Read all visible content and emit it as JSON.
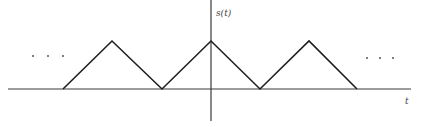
{
  "chart_data": {
    "type": "line",
    "title": "",
    "ylabel": "s(t)",
    "xlabel": "t",
    "grid": false,
    "legend": null,
    "continuation_marks": [
      "...",
      "..."
    ],
    "pixel_geometry": {
      "x_axis_y": 89,
      "x_axis_x_range": [
        8,
        411
      ],
      "y_axis_x": 211,
      "y_axis_y_range": [
        0,
        121
      ],
      "peak_y": 41,
      "points": [
        [
          63,
          89
        ],
        [
          112,
          41
        ],
        [
          162,
          89
        ],
        [
          211,
          41
        ],
        [
          260,
          89
        ],
        [
          309,
          41
        ],
        [
          357,
          89
        ]
      ]
    },
    "series": [
      {
        "name": "s(t)",
        "x": [
          -3,
          -2,
          -1,
          0,
          1,
          2,
          3
        ],
        "values": [
          0,
          1,
          0,
          1,
          0,
          1,
          0
        ]
      }
    ]
  },
  "labels": {
    "y_axis": "s(t)",
    "x_axis": "t",
    "ellipsis_left": "...",
    "ellipsis_right": "..."
  }
}
